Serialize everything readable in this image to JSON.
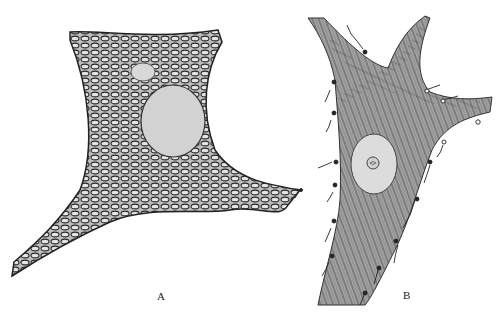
{
  "figure": {
    "panels": [
      {
        "label": "A",
        "description": "nerve cell with reticular fibrillar network and round nucleus"
      },
      {
        "label": "B",
        "description": "branched nerve cell with parallel fibrils, oval nucleus with nucleolus, and surrounding terminal boutons"
      }
    ],
    "colors": {
      "background": "#ffffff",
      "ink": "#2a2a2a",
      "nucleus": "#d4d4d4",
      "cytoplasm_b": "#9a9a9a"
    }
  }
}
